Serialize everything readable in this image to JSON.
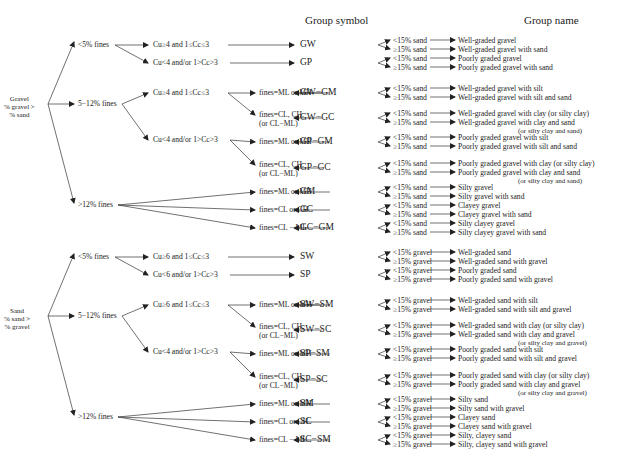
{
  "headers": {
    "group_symbol": "Group symbol",
    "group_name": "Group name"
  },
  "gravel": {
    "root": [
      "Gravel",
      "% gravel >",
      "% sand"
    ],
    "fines": [
      "<5% fines",
      "5−12% fines",
      ">12% fines"
    ],
    "grading": {
      "g1": "Cu≥4 and 1≤Cc≤3",
      "g2": "Cu<4 and/or 1>Cc>3",
      "g3": "Cu≥4 and 1≤Cc≤3",
      "g4": "Cu<4 and/or 1>Cc>3"
    },
    "fines_type": {
      "f1": "fines=ML or MH",
      "f2a": "fines=CL, CH,",
      "f2b": "(or CL−ML)",
      "f3": "fines=ML or MH",
      "f4a": "fines=CL, CH,",
      "f4b": "(or CL−ML)",
      "f5": "fines=ML or MH",
      "f6": "fines=CL or CH",
      "f7": "fines=CL − ML"
    },
    "symbols": [
      "GW",
      "GP",
      "GW−GM",
      "GW−GC",
      "GP−GM",
      "GP−GC",
      "GM",
      "GC",
      "GC−GM"
    ],
    "rows": [
      {
        "cond": "<15% sand",
        "name": "Well-graded gravel"
      },
      {
        "cond": "≥15% sand",
        "name": "Well-graded gravel with sand"
      },
      {
        "cond": "<15% sand",
        "name": "Poorly graded gravel"
      },
      {
        "cond": "≥15% sand",
        "name": "Poorly graded gravel with sand"
      },
      {
        "cond": "<15% sand",
        "name": "Well-graded gravel with silt"
      },
      {
        "cond": "≥15% sand",
        "name": "Well-graded gravel with silt and sand"
      },
      {
        "cond": "<15% sand",
        "name": "Well-graded gravel with clay (or silty clay)"
      },
      {
        "cond": "≥15% sand",
        "name": "Well-graded gravel with clay and sand",
        "note": "(or silty clay and sand)"
      },
      {
        "cond": "<15% sand",
        "name": "Poorly graded gravel with silt"
      },
      {
        "cond": "≥15% sand",
        "name": "Poorly graded gravel with silt and sand"
      },
      {
        "cond": "<15% sand",
        "name": "Poorly graded gravel with clay (or silty clay)"
      },
      {
        "cond": "≥15% sand",
        "name": "Poorly graded gravel with clay and sand",
        "note": "(or silty clay and sand)"
      },
      {
        "cond": "<15% sand",
        "name": "Silty gravel"
      },
      {
        "cond": "≥15% sand",
        "name": "Silty gravel with sand"
      },
      {
        "cond": "<15% sand",
        "name": "Clayey gravel"
      },
      {
        "cond": "≥15% sand",
        "name": "Clayey gravel with sand"
      },
      {
        "cond": "<15% sand",
        "name": "Silty clayey gravel"
      },
      {
        "cond": "≥15% sand",
        "name": "Silty clayey gravel with sand"
      }
    ]
  },
  "sand": {
    "root": [
      "Sand",
      "% sand >",
      "% gravel"
    ],
    "fines": [
      "<5% fines",
      "5−12% fines",
      ">12% fines"
    ],
    "grading": {
      "g1": "Cu≥6 and 1≤Cc≤3",
      "g2": "Cu<6 and/or 1>Cc>3",
      "g3": "Cu≥6 and 1≤Cc≤3",
      "g4": "Cu<4 and/or 1>Cc>3"
    },
    "fines_type": {
      "f1": "fines=ML or MH",
      "f2a": "fines=CL, CH,",
      "f2b": "(or CL−ML)",
      "f3": "fines=ML or MH",
      "f4a": "fines=CL, CH,",
      "f4b": "(or CL−ML)",
      "f5": "fines=ML or MH",
      "f6": "fines=CL or CH",
      "f7": "fines=CL − ML"
    },
    "symbols": [
      "SW",
      "SP",
      "SW−SM",
      "SW−SC",
      "SP−SM",
      "SP−SC",
      "SM",
      "SC",
      "SC−SM"
    ],
    "rows": [
      {
        "cond": "<15% gravel",
        "name": "Well-graded sand"
      },
      {
        "cond": "≥15% gravel",
        "name": "Well-graded sand with gravel"
      },
      {
        "cond": "<15% gravel",
        "name": "Poorly graded sand"
      },
      {
        "cond": "≥15% gravel",
        "name": "Poorly graded sand with gravel"
      },
      {
        "cond": "<15% gravel",
        "name": "Well-graded sand with silt"
      },
      {
        "cond": "≥15% gravel",
        "name": "Well-graded sand with silt and gravel"
      },
      {
        "cond": "<15% gravel",
        "name": "Well-graded sand with clay (or silty clay)"
      },
      {
        "cond": "≥15% gravel",
        "name": "Well-graded sand with clay and gravel",
        "note": "(or silty clay and gravel)"
      },
      {
        "cond": "<15% gravel",
        "name": "Poorly graded sand with silt"
      },
      {
        "cond": "≥15% gravel",
        "name": "Poorly graded sand with silt and gravel"
      },
      {
        "cond": "<15% gravel",
        "name": "Poorly graded sand with clay (or silty clay)"
      },
      {
        "cond": "≥15% gravel",
        "name": "Poorly graded sand with clay and gravel",
        "note": "(or silty clay and gravel)"
      },
      {
        "cond": "<15% gravel",
        "name": "Silty sand"
      },
      {
        "cond": "≥15% gravel",
        "name": "Silty sand with gravel"
      },
      {
        "cond": "<15% gravel",
        "name": "Clayey sand"
      },
      {
        "cond": "≥15% gravel",
        "name": "Clayey sand with gravel"
      },
      {
        "cond": "<15% gravel",
        "name": "Silty, clayey sand"
      },
      {
        "cond": "≥15% gravel",
        "name": "Silty, clayey sand with gravel"
      }
    ]
  }
}
